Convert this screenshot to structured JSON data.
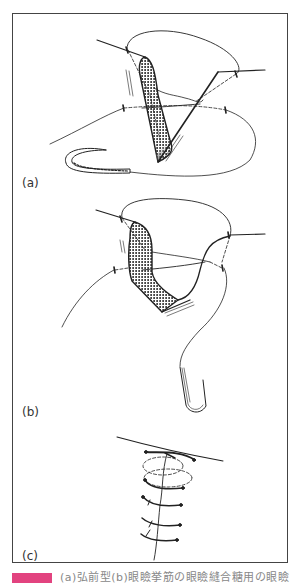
{
  "figure": {
    "panels": [
      {
        "id": "a",
        "label": "(a)",
        "description": "V-shaped tissue flap with suture passing through edges and curved needle"
      },
      {
        "id": "b",
        "label": "(b)",
        "description": "Flap folded with suture loops, curved needle below"
      },
      {
        "id": "c",
        "label": "(c)",
        "description": "Closed wound with series of interrupted sutures"
      }
    ],
    "frame_color": "#444444"
  },
  "caption": {
    "marker_color": "#e2437f",
    "text": "(a)弘前型(b)眼瞼挙筋の眼瞼縫合糖用の眼瞼"
  }
}
